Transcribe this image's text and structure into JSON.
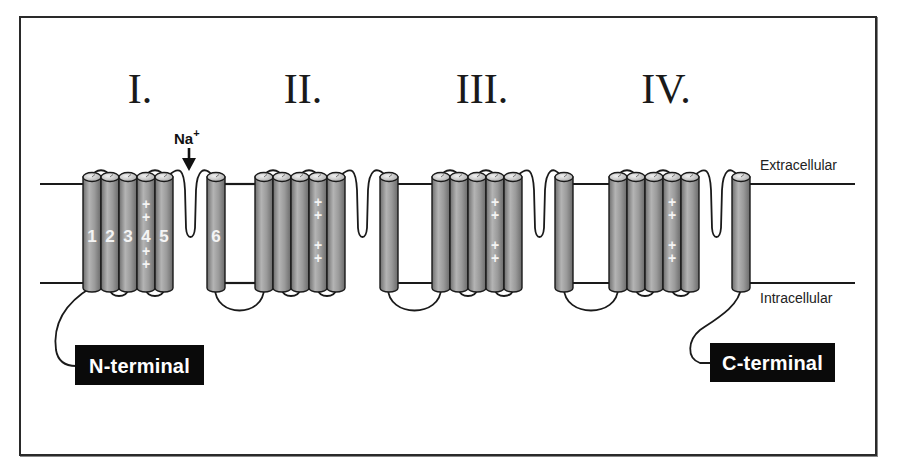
{
  "diagram": {
    "domains": [
      {
        "label": "I.",
        "numeral_x": 140,
        "s1_x": 83,
        "s6_x": 207,
        "numbered": true
      },
      {
        "label": "II.",
        "numeral_x": 303,
        "s1_x": 255,
        "s6_x": 380,
        "numbered": false
      },
      {
        "label": "III.",
        "numeral_x": 482,
        "s1_x": 432,
        "s6_x": 555,
        "numbered": false
      },
      {
        "label": "IV.",
        "numeral_x": 666,
        "s1_x": 609,
        "s6_x": 732,
        "numbered": false
      }
    ],
    "segment_labels": [
      "1",
      "2",
      "3",
      "4",
      "5",
      "6"
    ],
    "voltage_sensor_charge": "+",
    "ion": {
      "label": "Na",
      "superscript": "+",
      "arrow": "down-arrow"
    },
    "membrane": {
      "extracellular_label": "Extracellular",
      "intracellular_label": "Intracellular",
      "top_y": 184,
      "bottom_y": 283
    },
    "n_terminal": {
      "label": "N-terminal"
    },
    "c_terminal": {
      "label": "C-terminal"
    },
    "colors": {
      "helix_fill": "#8c8c8c",
      "helix_highlight": "#b8b8b8",
      "helix_cap": "#d6d6d6",
      "outline": "#1a1a1a",
      "label_box": "#0a0a0a",
      "label_text": "#ffffff"
    }
  }
}
